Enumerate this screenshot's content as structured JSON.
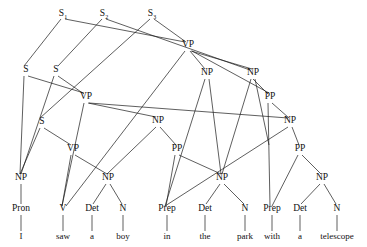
{
  "diagram": {
    "type": "syntax-parse-tree",
    "sentence": "I saw a boy in the park with a telescope",
    "line_color": "#1a1a1a",
    "background_color": "#ffffff",
    "words": [
      {
        "id": "w1",
        "text": "I",
        "x": 21,
        "y": 239
      },
      {
        "id": "w2",
        "text": "saw",
        "x": 63,
        "y": 239
      },
      {
        "id": "w3",
        "text": "a",
        "x": 92,
        "y": 239
      },
      {
        "id": "w4",
        "text": "boy",
        "x": 123,
        "y": 239
      },
      {
        "id": "w5",
        "text": "in",
        "x": 167,
        "y": 239
      },
      {
        "id": "w6",
        "text": "the",
        "x": 205,
        "y": 239
      },
      {
        "id": "w7",
        "text": "park",
        "x": 245,
        "y": 239
      },
      {
        "id": "w8",
        "text": "with",
        "x": 272,
        "y": 239
      },
      {
        "id": "w9",
        "text": "a",
        "x": 300,
        "y": 239
      },
      {
        "id": "w10",
        "text": "telescope",
        "x": 337,
        "y": 239
      }
    ],
    "pos_nodes": [
      {
        "id": "p1",
        "label": "Pron",
        "x": 21,
        "y": 211
      },
      {
        "id": "p2",
        "label": "V",
        "x": 63,
        "y": 211
      },
      {
        "id": "p3",
        "label": "Det",
        "x": 92,
        "y": 211
      },
      {
        "id": "p4",
        "label": "N",
        "x": 123,
        "y": 211
      },
      {
        "id": "p5",
        "label": "Prep",
        "x": 167,
        "y": 211
      },
      {
        "id": "p6",
        "label": "Det",
        "x": 205,
        "y": 211
      },
      {
        "id": "p7",
        "label": "N",
        "x": 245,
        "y": 211
      },
      {
        "id": "p8",
        "label": "Prep",
        "x": 272,
        "y": 211
      },
      {
        "id": "p9",
        "label": "Det",
        "x": 300,
        "y": 211
      },
      {
        "id": "p10",
        "label": "N",
        "x": 337,
        "y": 211
      }
    ],
    "phrase_nodes": [
      {
        "id": "n_s1",
        "label": "S",
        "sub": "1",
        "x": 63,
        "y": 16
      },
      {
        "id": "n_s2",
        "label": "S",
        "sub": "2",
        "x": 104,
        "y": 16
      },
      {
        "id": "n_s3",
        "label": "S",
        "sub": "3",
        "x": 152,
        "y": 16
      },
      {
        "id": "n_vp_t",
        "label": "VP",
        "sub": "",
        "x": 188,
        "y": 47
      },
      {
        "id": "n_sa",
        "label": "S",
        "sub": "",
        "x": 26,
        "y": 72
      },
      {
        "id": "n_sb",
        "label": "S",
        "sub": "",
        "x": 56,
        "y": 72
      },
      {
        "id": "n_np_a",
        "label": "NP",
        "sub": "",
        "x": 207,
        "y": 75
      },
      {
        "id": "n_np_b",
        "label": "NP",
        "sub": "",
        "x": 253,
        "y": 75
      },
      {
        "id": "n_vp_m",
        "label": "VP",
        "sub": "",
        "x": 86,
        "y": 99
      },
      {
        "id": "n_pp_a",
        "label": "PP",
        "sub": "",
        "x": 270,
        "y": 99
      },
      {
        "id": "n_sc",
        "label": "S",
        "sub": "",
        "x": 42,
        "y": 124
      },
      {
        "id": "n_np_c",
        "label": "NP",
        "sub": "",
        "x": 158,
        "y": 123
      },
      {
        "id": "n_np_d",
        "label": "NP",
        "sub": "",
        "x": 290,
        "y": 123
      },
      {
        "id": "n_vp_l",
        "label": "VP",
        "sub": "",
        "x": 73,
        "y": 151
      },
      {
        "id": "n_pp_b",
        "label": "PP",
        "sub": "",
        "x": 177,
        "y": 151
      },
      {
        "id": "n_pp_c",
        "label": "PP",
        "sub": "",
        "x": 300,
        "y": 151
      },
      {
        "id": "n_np_1",
        "label": "NP",
        "sub": "",
        "x": 21,
        "y": 180
      },
      {
        "id": "n_np_2",
        "label": "NP",
        "sub": "",
        "x": 108,
        "y": 180
      },
      {
        "id": "n_np_3",
        "label": "NP",
        "sub": "",
        "x": 222,
        "y": 180
      },
      {
        "id": "n_np_4",
        "label": "NP",
        "sub": "",
        "x": 322,
        "y": 180
      }
    ],
    "edges": [
      {
        "x1": 61,
        "y1": 19,
        "x2": 24,
        "y2": 66
      },
      {
        "x1": 65,
        "y1": 19,
        "x2": 185,
        "y2": 42
      },
      {
        "x1": 102,
        "y1": 19,
        "x2": 58,
        "y2": 66
      },
      {
        "x1": 106,
        "y1": 19,
        "x2": 250,
        "y2": 70
      },
      {
        "x1": 150,
        "y1": 19,
        "x2": 40,
        "y2": 118
      },
      {
        "x1": 154,
        "y1": 19,
        "x2": 186,
        "y2": 42
      },
      {
        "x1": 185,
        "y1": 51,
        "x2": 66,
        "y2": 206
      },
      {
        "x1": 190,
        "y1": 51,
        "x2": 205,
        "y2": 69
      },
      {
        "x1": 191,
        "y1": 51,
        "x2": 252,
        "y2": 69
      },
      {
        "x1": 192,
        "y1": 51,
        "x2": 269,
        "y2": 93
      },
      {
        "x1": 24,
        "y1": 76,
        "x2": 20,
        "y2": 174
      },
      {
        "x1": 28,
        "y1": 76,
        "x2": 84,
        "y2": 93
      },
      {
        "x1": 54,
        "y1": 76,
        "x2": 21,
        "y2": 174
      },
      {
        "x1": 58,
        "y1": 76,
        "x2": 84,
        "y2": 94
      },
      {
        "x1": 205,
        "y1": 79,
        "x2": 165,
        "y2": 206
      },
      {
        "x1": 209,
        "y1": 79,
        "x2": 221,
        "y2": 174
      },
      {
        "x1": 251,
        "y1": 79,
        "x2": 222,
        "y2": 174
      },
      {
        "x1": 255,
        "y1": 79,
        "x2": 269,
        "y2": 145
      },
      {
        "x1": 253,
        "y1": 79,
        "x2": 268,
        "y2": 94
      },
      {
        "x1": 84,
        "y1": 103,
        "x2": 62,
        "y2": 206
      },
      {
        "x1": 88,
        "y1": 103,
        "x2": 156,
        "y2": 117
      },
      {
        "x1": 89,
        "y1": 103,
        "x2": 288,
        "y2": 118
      },
      {
        "x1": 268,
        "y1": 103,
        "x2": 270,
        "y2": 206
      },
      {
        "x1": 272,
        "y1": 103,
        "x2": 289,
        "y2": 118
      },
      {
        "x1": 40,
        "y1": 128,
        "x2": 20,
        "y2": 174
      },
      {
        "x1": 44,
        "y1": 128,
        "x2": 71,
        "y2": 145
      },
      {
        "x1": 156,
        "y1": 127,
        "x2": 107,
        "y2": 174
      },
      {
        "x1": 160,
        "y1": 127,
        "x2": 176,
        "y2": 145
      },
      {
        "x1": 288,
        "y1": 127,
        "x2": 165,
        "y2": 206
      },
      {
        "x1": 292,
        "y1": 127,
        "x2": 299,
        "y2": 145
      },
      {
        "x1": 71,
        "y1": 155,
        "x2": 62,
        "y2": 206
      },
      {
        "x1": 75,
        "y1": 155,
        "x2": 107,
        "y2": 174
      },
      {
        "x1": 175,
        "y1": 155,
        "x2": 166,
        "y2": 206
      },
      {
        "x1": 179,
        "y1": 155,
        "x2": 221,
        "y2": 174
      },
      {
        "x1": 298,
        "y1": 155,
        "x2": 272,
        "y2": 206
      },
      {
        "x1": 302,
        "y1": 155,
        "x2": 321,
        "y2": 174
      },
      {
        "x1": 21,
        "y1": 184,
        "x2": 21,
        "y2": 204
      },
      {
        "x1": 106,
        "y1": 184,
        "x2": 93,
        "y2": 204
      },
      {
        "x1": 110,
        "y1": 184,
        "x2": 122,
        "y2": 204
      },
      {
        "x1": 220,
        "y1": 184,
        "x2": 206,
        "y2": 204
      },
      {
        "x1": 224,
        "y1": 184,
        "x2": 244,
        "y2": 204
      },
      {
        "x1": 320,
        "y1": 184,
        "x2": 301,
        "y2": 204
      },
      {
        "x1": 324,
        "y1": 184,
        "x2": 336,
        "y2": 204
      },
      {
        "x1": 21,
        "y1": 215,
        "x2": 21,
        "y2": 231
      },
      {
        "x1": 63,
        "y1": 215,
        "x2": 63,
        "y2": 231
      },
      {
        "x1": 92,
        "y1": 215,
        "x2": 92,
        "y2": 231
      },
      {
        "x1": 123,
        "y1": 215,
        "x2": 123,
        "y2": 231
      },
      {
        "x1": 167,
        "y1": 215,
        "x2": 167,
        "y2": 231
      },
      {
        "x1": 205,
        "y1": 215,
        "x2": 205,
        "y2": 231
      },
      {
        "x1": 245,
        "y1": 215,
        "x2": 245,
        "y2": 231
      },
      {
        "x1": 272,
        "y1": 215,
        "x2": 272,
        "y2": 231
      },
      {
        "x1": 300,
        "y1": 215,
        "x2": 300,
        "y2": 231
      },
      {
        "x1": 337,
        "y1": 215,
        "x2": 337,
        "y2": 231
      }
    ]
  }
}
